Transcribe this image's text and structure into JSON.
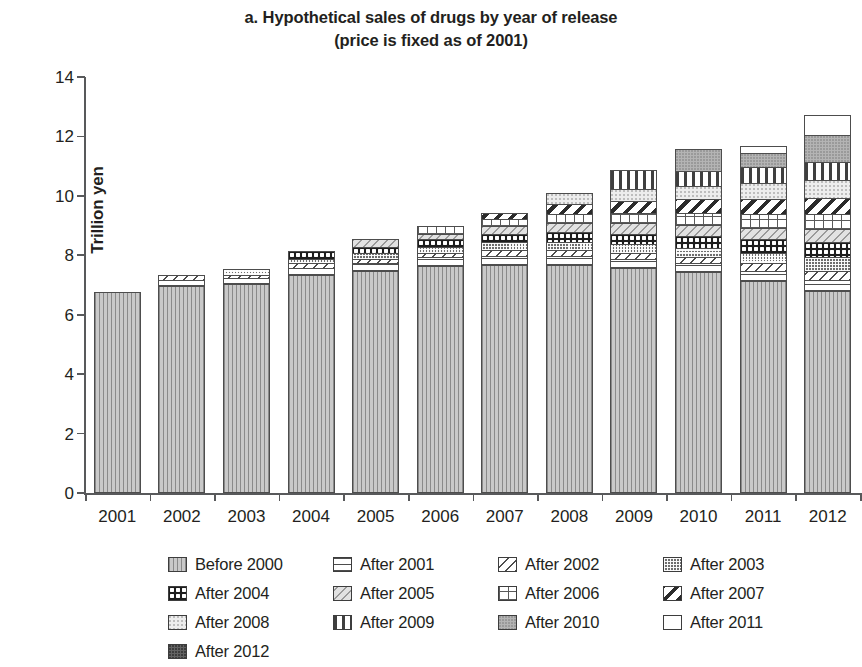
{
  "chart_data": {
    "type": "bar",
    "subtype": "stacked",
    "title": "a. Hypothetical sales of drugs by year of release",
    "subtitle": "(price is fixed as of 2001)",
    "xlabel": "",
    "ylabel": "Trillion yen",
    "ylim": [
      0,
      14
    ],
    "yticks": [
      0,
      2,
      4,
      6,
      8,
      10,
      12,
      14
    ],
    "grid": false,
    "legend_position": "bottom",
    "categories": [
      "2001",
      "2002",
      "2003",
      "2004",
      "2005",
      "2006",
      "2007",
      "2008",
      "2009",
      "2010",
      "2011",
      "2012"
    ],
    "totals": [
      6.72,
      7.3,
      7.5,
      8.1,
      8.5,
      8.95,
      9.4,
      10.05,
      10.55,
      11.35,
      11.65,
      12.2
    ],
    "series": [
      {
        "name": "Before 2000",
        "pattern": "vertical-lines",
        "values": [
          6.72,
          6.95,
          7.0,
          7.3,
          7.45,
          7.6,
          7.65,
          7.65,
          7.55,
          7.4,
          7.1,
          6.75
        ]
      },
      {
        "name": "After 2001",
        "pattern": "horizontal-lines",
        "values": [
          0.0,
          0.2,
          0.2,
          0.25,
          0.25,
          0.3,
          0.3,
          0.3,
          0.3,
          0.3,
          0.35,
          0.4
        ]
      },
      {
        "name": "After 2002",
        "pattern": "diagonal-hatch",
        "values": [
          0.0,
          0.15,
          0.1,
          0.15,
          0.15,
          0.15,
          0.2,
          0.2,
          0.2,
          0.2,
          0.25,
          0.3
        ]
      },
      {
        "name": "After 2003",
        "pattern": "checker",
        "values": [
          0.0,
          0.0,
          0.2,
          0.15,
          0.2,
          0.2,
          0.25,
          0.25,
          0.3,
          0.3,
          0.35,
          0.45
        ]
      },
      {
        "name": "After 2004",
        "pattern": "dots-on-dark",
        "values": [
          0.0,
          0.0,
          0.0,
          0.25,
          0.2,
          0.25,
          0.3,
          0.35,
          0.35,
          0.4,
          0.45,
          0.5
        ]
      },
      {
        "name": "After 2005",
        "pattern": "light-diagonal",
        "values": [
          0.0,
          0.0,
          0.0,
          0.0,
          0.25,
          0.2,
          0.25,
          0.3,
          0.35,
          0.4,
          0.4,
          0.45
        ]
      },
      {
        "name": "After 2006",
        "pattern": "grid",
        "values": [
          0.0,
          0.0,
          0.0,
          0.0,
          0.0,
          0.25,
          0.25,
          0.3,
          0.35,
          0.4,
          0.45,
          0.5
        ]
      },
      {
        "name": "After 2007",
        "pattern": "bold-diagonal",
        "values": [
          0.0,
          0.0,
          0.0,
          0.0,
          0.0,
          0.0,
          0.2,
          0.35,
          0.4,
          0.45,
          0.5,
          0.55
        ]
      },
      {
        "name": "After 2008",
        "pattern": "light-speckle",
        "values": [
          0.0,
          0.0,
          0.0,
          0.0,
          0.0,
          0.0,
          0.0,
          0.35,
          0.4,
          0.45,
          0.55,
          0.6
        ]
      },
      {
        "name": "After 2009",
        "pattern": "vertical-bars",
        "values": [
          0.0,
          0.0,
          0.0,
          0.0,
          0.0,
          0.0,
          0.0,
          0.0,
          0.65,
          0.5,
          0.55,
          0.6
        ]
      },
      {
        "name": "After 2010",
        "pattern": "medium-gray",
        "values": [
          0.0,
          0.0,
          0.0,
          0.0,
          0.0,
          0.0,
          0.0,
          0.0,
          0.0,
          0.75,
          0.45,
          0.9
        ]
      },
      {
        "name": "After 2011",
        "pattern": "white",
        "values": [
          0.0,
          0.0,
          0.0,
          0.0,
          0.0,
          0.0,
          0.0,
          0.0,
          0.0,
          0.0,
          0.25,
          0.7
        ]
      },
      {
        "name": "After 2012",
        "pattern": "dark-solid",
        "values": [
          0.0,
          0.0,
          0.0,
          0.0,
          0.0,
          0.0,
          0.0,
          0.0,
          0.0,
          0.0,
          0.0,
          0.0
        ]
      }
    ]
  },
  "legend": {
    "entries": [
      {
        "label": "Before 2000",
        "key": "before2000"
      },
      {
        "label": "After 2001",
        "key": "after2001"
      },
      {
        "label": "After 2002",
        "key": "after2002"
      },
      {
        "label": "After 2003",
        "key": "after2003"
      },
      {
        "label": "After 2004",
        "key": "after2004"
      },
      {
        "label": "After 2005",
        "key": "after2005"
      },
      {
        "label": "After 2006",
        "key": "after2006"
      },
      {
        "label": "After 2007",
        "key": "after2007"
      },
      {
        "label": "After 2008",
        "key": "after2008"
      },
      {
        "label": "After 2009",
        "key": "after2009"
      },
      {
        "label": "After 2010",
        "key": "after2010"
      },
      {
        "label": "After 2011",
        "key": "after2011"
      },
      {
        "label": "After 2012",
        "key": "after2012"
      }
    ]
  },
  "colors": {
    "axis": "#58595b",
    "text": "#231f20",
    "outline": "#4d4d4d"
  }
}
